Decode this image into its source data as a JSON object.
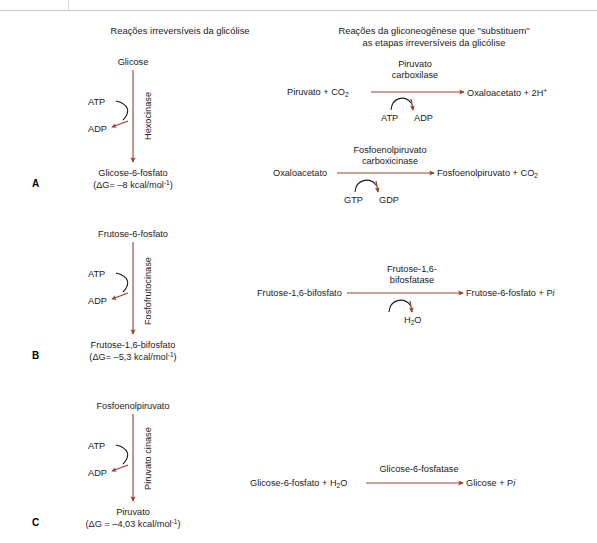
{
  "figure": {
    "column_titles": {
      "left": "Reações irreversíveis da glicólise",
      "right_line1": "Reações da gliconeogênese que \"substituem\"",
      "right_line2": "as etapas irreversíveis da glicólise"
    },
    "panel_letters": {
      "a": "A",
      "b": "B",
      "c": "C"
    },
    "arrow_color": "#9c3c2f",
    "text_color": "#1a1a1a"
  },
  "panels": [
    {
      "letter": "A",
      "glycolysis": {
        "substrate": "Glicose",
        "enzyme": "Hexocinase",
        "cofactor_in": "ATP",
        "cofactor_out": "ADP",
        "product": "Glicose-6-fosfato",
        "delta_g": "(ΔG= –8 kcal/mol",
        "delta_g_sup": "-1",
        "delta_g_close": ")"
      },
      "gluconeogenesis": [
        {
          "substrate_pre": "Piruvato + CO",
          "substrate_sub": "2",
          "enzyme_line1": "Piruvato",
          "enzyme_line2": "carboxilase",
          "cofactor_in": "ATP",
          "cofactor_out": "ADP",
          "product_pre": "Oxaloacetato + 2H",
          "product_sup": "+"
        },
        {
          "substrate_pre": "Oxaloacetato",
          "substrate_sub": "",
          "enzyme_line1": "Fosfoenolpiruvato",
          "enzyme_line2": "carboxicinase",
          "cofactor_in": "GTP",
          "cofactor_out": "GDP",
          "product_pre": "Fosfoenolpiruvato + CO",
          "product_sup": "",
          "product_sub": "2"
        }
      ]
    },
    {
      "letter": "B",
      "glycolysis": {
        "substrate": "Frutose-6-fosfato",
        "enzyme": "Fosfofrutocinase",
        "cofactor_in": "ATP",
        "cofactor_out": "ADP",
        "product": "Frutose-1,6-bifosfato",
        "delta_g": "(ΔG= –5,3 kcal/mol",
        "delta_g_sup": "-1",
        "delta_g_close": ")"
      },
      "gluconeogenesis": [
        {
          "substrate_pre": "Frutose-1,6-bifosfato",
          "enzyme_line1": "Frutose-1,6-",
          "enzyme_line2": "bifosfatase",
          "cofactor_out_pre": "H",
          "cofactor_out_sub": "2",
          "cofactor_out_post": "O",
          "product_pre": "Frutose-6-fosfato + P",
          "product_italic": "i"
        }
      ]
    },
    {
      "letter": "C",
      "glycolysis": {
        "substrate": "Fosfoenolpiruvato",
        "enzyme": "Piruvato cinase",
        "cofactor_in": "ATP",
        "cofactor_out": "ADP",
        "product": "Piruvato",
        "delta_g": "(ΔG = –4,03 kcal/mol",
        "delta_g_sup": "-1",
        "delta_g_close": ")"
      },
      "gluconeogenesis": [
        {
          "substrate_pre": "Glicose-6-fosfato + H",
          "substrate_sub": "2",
          "substrate_post": "O",
          "enzyme_line1": "Glicose-6-fosfatase",
          "product_pre": "Glicose + P",
          "product_italic": "i"
        }
      ]
    }
  ]
}
